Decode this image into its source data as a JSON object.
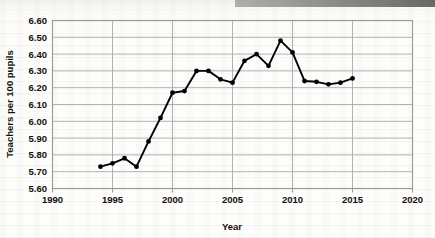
{
  "chart_data": {
    "type": "line",
    "title": "",
    "xlabel": "Year",
    "ylabel": "Teachers per 100 pupils",
    "xlim": [
      1990,
      2020
    ],
    "ylim": [
      5.6,
      6.6
    ],
    "grid": true,
    "legend": null,
    "x_ticks": [
      "1990",
      "1995",
      "2000",
      "2005",
      "2010",
      "2015",
      "2020"
    ],
    "x_tick_values": [
      1990,
      1995,
      2000,
      2005,
      2010,
      2015,
      2020
    ],
    "y_ticks": [
      "5.60",
      "5.70",
      "5.80",
      "5.90",
      "6.00",
      "6.10",
      "6.20",
      "6.30",
      "6.40",
      "6.50",
      "6.60"
    ],
    "y_tick_values": [
      5.6,
      5.7,
      5.8,
      5.9,
      6.0,
      6.1,
      6.2,
      6.3,
      6.4,
      6.5,
      6.6
    ],
    "series_color": "#000000",
    "marker": "circle",
    "x": [
      1994,
      1995,
      1996,
      1997,
      1998,
      1999,
      2000,
      2001,
      2002,
      2003,
      2004,
      2005,
      2006,
      2007,
      2008,
      2009,
      2010,
      2011,
      2012,
      2013,
      2014,
      2015
    ],
    "values": [
      5.73,
      5.75,
      5.78,
      5.73,
      5.88,
      6.02,
      6.17,
      6.18,
      6.3,
      6.3,
      6.25,
      6.23,
      6.36,
      6.4,
      6.33,
      6.48,
      6.41,
      6.24,
      6.235,
      6.22,
      6.23,
      6.255
    ],
    "categories": [
      "1994",
      "1995",
      "1996",
      "1997",
      "1998",
      "1999",
      "2000",
      "2001",
      "2002",
      "2003",
      "2004",
      "2005",
      "2006",
      "2007",
      "2008",
      "2009",
      "2010",
      "2011",
      "2012",
      "2013",
      "2014",
      "2015"
    ]
  }
}
